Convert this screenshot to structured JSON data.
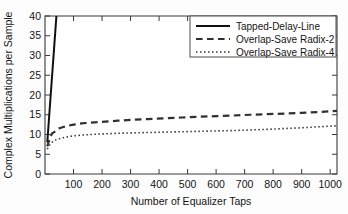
{
  "figure": {
    "name": "complex-multiplications-per-sample-plot",
    "background": "#fdfdfd",
    "foreground": "#141414"
  },
  "chart_data": {
    "type": "line",
    "title": "",
    "xlabel": "Number of Equalizer Taps",
    "ylabel": "Complex Multiplications per Sample",
    "xlim": [
      0,
      1024
    ],
    "ylim": [
      0,
      40
    ],
    "xticks": [
      100,
      200,
      300,
      400,
      500,
      600,
      700,
      800,
      900,
      1000
    ],
    "yticks": [
      0,
      5,
      10,
      15,
      20,
      25,
      30,
      35,
      40
    ],
    "xticklabels": [
      "100",
      "200",
      "300",
      "400",
      "500",
      "600",
      "700",
      "800",
      "900",
      "1000"
    ],
    "yticklabels": [
      "0",
      "5",
      "10",
      "15",
      "20",
      "25",
      "30",
      "35",
      "40"
    ],
    "grid": false,
    "legend_position": "upper right",
    "x": [
      8,
      16,
      24,
      32,
      40,
      48,
      64,
      80,
      100,
      128,
      160,
      200,
      256,
      300,
      360,
      420,
      480,
      540,
      600,
      660,
      720,
      780,
      840,
      900,
      960,
      1024
    ],
    "series": [
      {
        "name": "Tapped-Delay-Line",
        "label": "Tapped-Delay-Line",
        "linestyle": "solid",
        "color": "#111111",
        "linewidth": 2.0,
        "values": [
          8,
          16,
          24,
          32,
          40,
          48,
          64,
          80,
          100,
          128,
          160,
          200,
          256,
          300,
          360,
          420,
          480,
          540,
          600,
          660,
          720,
          780,
          840,
          900,
          960,
          1024
        ]
      },
      {
        "name": "Overlap-Save Radix-2",
        "label": "Overlap-Save Radix-2",
        "linestyle": "dashed",
        "color": "#303030",
        "linewidth": 2.2,
        "values": [
          7.0,
          8.9,
          10.2,
          10.6,
          11.1,
          11.5,
          11.9,
          12.2,
          12.5,
          12.8,
          13.0,
          13.2,
          13.5,
          13.7,
          13.9,
          14.1,
          14.3,
          14.5,
          14.65,
          14.8,
          15.0,
          15.15,
          15.3,
          15.5,
          15.7,
          16.0
        ]
      },
      {
        "name": "Overlap-Save Radix-4",
        "label": "Overlap-Save Radix-4",
        "linestyle": "dotted",
        "color": "#3a3a3a",
        "linewidth": 1.6,
        "values": [
          6.3,
          7.3,
          8.0,
          8.4,
          8.7,
          8.9,
          9.2,
          9.45,
          9.65,
          9.85,
          10.0,
          10.15,
          10.3,
          10.4,
          10.5,
          10.6,
          10.7,
          10.8,
          10.9,
          11.0,
          11.15,
          11.3,
          11.5,
          11.7,
          11.95,
          12.2
        ]
      }
    ]
  },
  "legend": {
    "entries": [
      {
        "label": "Tapped-Delay-Line",
        "style": "solid"
      },
      {
        "label": "Overlap-Save Radix-2",
        "style": "dashed"
      },
      {
        "label": "Overlap-Save Radix-4",
        "style": "dotted"
      }
    ]
  }
}
